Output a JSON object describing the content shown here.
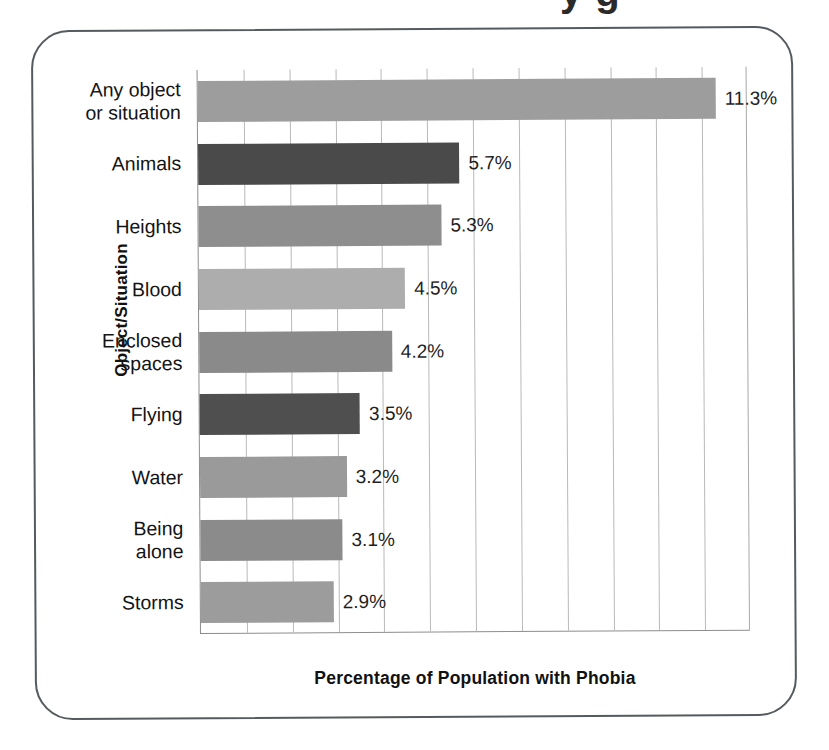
{
  "figure": {
    "frame_style": "rounded-box",
    "clipped_title_fragment": "y         g"
  },
  "chart_data": {
    "type": "bar",
    "orientation": "horizontal",
    "title": "",
    "xlabel": "Percentage of Population with Phobia",
    "ylabel": "Object/Situation",
    "xlim": [
      0,
      12
    ],
    "grid": true,
    "gridline_count": 12,
    "legend": "none",
    "categories": [
      "Any object\nor situation",
      "Animals",
      "Heights",
      "Blood",
      "Enclosed\nspaces",
      "Flying",
      "Water",
      "Being\nalone",
      "Storms"
    ],
    "values": [
      11.3,
      5.7,
      5.3,
      4.5,
      4.2,
      3.5,
      3.2,
      3.1,
      2.9
    ],
    "value_labels": [
      "11.3%",
      "5.7%",
      "5.3%",
      "4.5%",
      "4.2%",
      "3.5%",
      "3.2%",
      "3.1%",
      "2.9%"
    ],
    "bar_colors": [
      "#9d9d9d",
      "#4a4a4a",
      "#8e8e8e",
      "#adadad",
      "#8a8a8a",
      "#4f4f4f",
      "#9a9a9a",
      "#8b8b8b",
      "#9c9c9c"
    ],
    "axis_color": "#8d8d8d",
    "gridline_color": "#b9b9b9"
  }
}
